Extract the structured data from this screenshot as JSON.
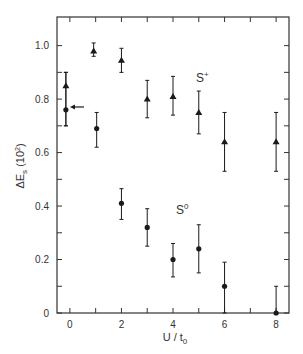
{
  "chart_data": {
    "type": "scatter",
    "title": "",
    "xlabel": "U / t0",
    "ylabel": "ΔEs (10²)",
    "xlim": [
      -0.5,
      8.5
    ],
    "ylim": [
      0,
      1.107
    ],
    "xticks": [
      0,
      1,
      2,
      3,
      4,
      5,
      6,
      7,
      8
    ],
    "xtick_labels": [
      "0",
      "2",
      "4",
      "6",
      "8"
    ],
    "xtick_label_values": [
      0,
      2,
      4,
      6,
      8
    ],
    "yticks": [
      0,
      0.1,
      0.2,
      0.3,
      0.4,
      0.5,
      0.6,
      0.7,
      0.8,
      0.9,
      1.0
    ],
    "ytick_labels": [
      "0",
      "0.2",
      "0.4",
      "0.6",
      "0.8",
      "1.0"
    ],
    "ytick_label_values": [
      0,
      0.2,
      0.4,
      0.6,
      0.8,
      1.0
    ],
    "grid": false,
    "series": [
      {
        "name": "S+",
        "marker": "triangle",
        "x": [
          0,
          1,
          2,
          3,
          4,
          5,
          6,
          8
        ],
        "values": [
          0.85,
          0.98,
          0.945,
          0.8,
          0.81,
          0.75,
          0.64,
          0.64
        ],
        "err_low": [
          0.7,
          0.96,
          0.9,
          0.73,
          0.74,
          0.67,
          0.53,
          0.53
        ],
        "err_high": [
          0.9,
          1.01,
          0.99,
          0.87,
          0.885,
          0.83,
          0.75,
          0.75
        ]
      },
      {
        "name": "S0",
        "marker": "circle",
        "x": [
          0,
          1,
          2,
          3,
          4,
          5,
          6,
          8
        ],
        "values": [
          0.76,
          0.69,
          0.41,
          0.32,
          0.2,
          0.24,
          0.1,
          0.0
        ],
        "err_low": [
          0.7,
          0.62,
          0.35,
          0.25,
          0.135,
          0.15,
          0.0,
          0.0
        ],
        "err_high": [
          0.9,
          0.75,
          0.465,
          0.39,
          0.26,
          0.33,
          0.19,
          0.1
        ]
      }
    ],
    "annotations": [
      {
        "text": "S+",
        "x": 5.6,
        "y": 0.85,
        "kind": "series-label"
      },
      {
        "text": "S0",
        "x": 3.0,
        "y": 0.46,
        "kind": "series-label"
      },
      {
        "text": "arrow",
        "x": 0.25,
        "y": 0.77,
        "kind": "arrow-pointing-left"
      }
    ]
  },
  "labels": {
    "y_axis_main": "ΔE",
    "y_axis_sub": "s",
    "y_axis_unit": " (10",
    "y_axis_unit_sup": "2",
    "y_axis_unit_close": ")",
    "x_axis_main": "U / t",
    "x_axis_sub": "0",
    "splus_main": "S",
    "splus_sup": "+",
    "szero_main": "S",
    "szero_sup": "0"
  },
  "colors": {
    "ink": "#1a1a1a",
    "axis": "#333333",
    "background": "#ffffff"
  }
}
